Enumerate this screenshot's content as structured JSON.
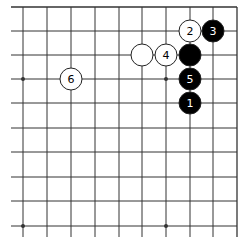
{
  "board": {
    "view": "top-right corner",
    "columns_x": [
      23,
      47,
      71,
      95,
      119,
      142,
      166,
      190,
      213,
      237
    ],
    "rows_y": [
      7,
      31,
      55,
      79,
      103,
      128,
      152,
      177,
      201,
      226
    ],
    "line_extent": {
      "left": 11,
      "bottom": 237
    },
    "edges": {
      "top": true,
      "right": true
    },
    "star_points": [
      {
        "col": 0,
        "row": 3
      },
      {
        "col": 6,
        "row": 3
      },
      {
        "col": 0,
        "row": 9
      },
      {
        "col": 6,
        "row": 9
      }
    ],
    "stone_radius": 11,
    "colors": {
      "line": "#333333",
      "black_stone": "#000000",
      "white_stone": "#ffffff",
      "stone_outline": "#222222"
    }
  },
  "stones": [
    {
      "color": "black",
      "col": 7,
      "row": 4,
      "label": "1"
    },
    {
      "color": "white",
      "col": 7,
      "row": 1,
      "label": "2"
    },
    {
      "color": "black",
      "col": 8,
      "row": 1,
      "label": "3"
    },
    {
      "color": "white",
      "col": 6,
      "row": 2,
      "label": "4"
    },
    {
      "color": "black",
      "col": 7,
      "row": 3,
      "label": "5"
    },
    {
      "color": "white",
      "col": 2,
      "row": 3,
      "label": "6"
    },
    {
      "color": "white",
      "col": 5,
      "row": 2,
      "label": ""
    },
    {
      "color": "black",
      "col": 7,
      "row": 2,
      "label": ""
    }
  ]
}
